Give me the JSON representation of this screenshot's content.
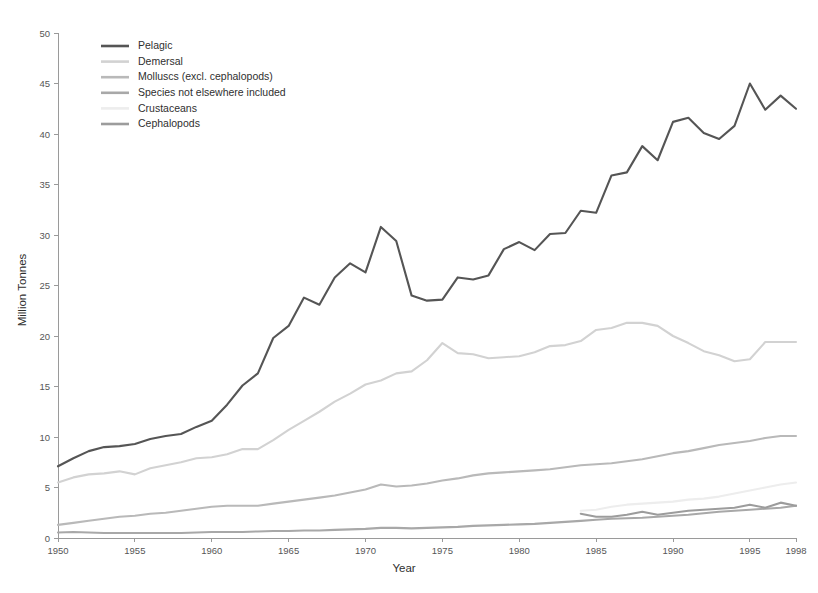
{
  "chart_data": {
    "type": "line",
    "title": "",
    "xlabel": "Year",
    "ylabel": "Million Tonnes",
    "xlim": [
      1950,
      1998
    ],
    "ylim": [
      0,
      50
    ],
    "yticks": [
      0,
      5,
      10,
      15,
      20,
      25,
      30,
      35,
      40,
      45,
      50
    ],
    "xticks": [
      1950,
      1955,
      1960,
      1965,
      1970,
      1975,
      1980,
      1985,
      1990,
      1995,
      1998
    ],
    "grid": false,
    "legend_position": "top-left",
    "x": [
      1950,
      1951,
      1952,
      1953,
      1954,
      1955,
      1956,
      1957,
      1958,
      1959,
      1960,
      1961,
      1962,
      1963,
      1964,
      1965,
      1966,
      1967,
      1968,
      1969,
      1970,
      1971,
      1972,
      1973,
      1974,
      1975,
      1976,
      1977,
      1978,
      1979,
      1980,
      1981,
      1982,
      1983,
      1984,
      1985,
      1986,
      1987,
      1988,
      1989,
      1990,
      1991,
      1992,
      1993,
      1994,
      1995,
      1996,
      1997,
      1998
    ],
    "series": [
      {
        "name": "Pelagic",
        "color": "#555555",
        "x": [
          1950,
          1951,
          1952,
          1953,
          1954,
          1955,
          1956,
          1957,
          1958,
          1959,
          1960,
          1961,
          1962,
          1963,
          1964,
          1965,
          1966,
          1967,
          1968,
          1969,
          1970,
          1971,
          1972,
          1973,
          1974,
          1975,
          1976,
          1977,
          1978,
          1979,
          1980,
          1981,
          1982,
          1983,
          1984,
          1985,
          1986,
          1987,
          1988,
          1989,
          1990,
          1991,
          1992,
          1993,
          1994,
          1995,
          1996,
          1997,
          1998
        ],
        "values": [
          7.1,
          7.9,
          8.6,
          9.0,
          9.1,
          9.3,
          9.8,
          10.1,
          10.3,
          11.0,
          11.6,
          13.2,
          15.1,
          16.3,
          19.8,
          21.0,
          23.8,
          23.1,
          25.8,
          27.2,
          26.3,
          30.8,
          29.4,
          24.0,
          23.5,
          23.6,
          25.8,
          25.6,
          26.0,
          28.6,
          29.3,
          28.5,
          30.1,
          30.2,
          32.4,
          32.2,
          35.9,
          36.2,
          38.8,
          37.4,
          41.2,
          41.6,
          40.1,
          39.5,
          40.8,
          45.0,
          42.4,
          43.8,
          42.5
        ]
      },
      {
        "name": "Demersal",
        "color": "#d2d2d2",
        "x": [
          1950,
          1951,
          1952,
          1953,
          1954,
          1955,
          1956,
          1957,
          1958,
          1959,
          1960,
          1961,
          1962,
          1963,
          1964,
          1965,
          1966,
          1967,
          1968,
          1969,
          1970,
          1971,
          1972,
          1973,
          1974,
          1975,
          1976,
          1977,
          1978,
          1979,
          1980,
          1981,
          1982,
          1983,
          1984,
          1985,
          1986,
          1987,
          1988,
          1989,
          1990,
          1991,
          1992,
          1993,
          1994,
          1995,
          1996,
          1997,
          1998
        ],
        "values": [
          5.5,
          6.0,
          6.3,
          6.4,
          6.6,
          6.3,
          6.9,
          7.2,
          7.5,
          7.9,
          8.0,
          8.3,
          8.8,
          8.8,
          9.7,
          10.7,
          11.6,
          12.5,
          13.5,
          14.3,
          15.2,
          15.6,
          16.3,
          16.5,
          17.6,
          19.3,
          18.3,
          18.2,
          17.8,
          17.9,
          18.0,
          18.4,
          19.0,
          19.1,
          19.5,
          20.6,
          20.8,
          21.3,
          21.3,
          21.0,
          20.0,
          19.3,
          18.5,
          18.1,
          17.5,
          17.7,
          19.4,
          19.4,
          19.4
        ]
      },
      {
        "name": "Molluscs (excl. cephalopods)",
        "color": "#b9b9b9",
        "x": [
          1950,
          1951,
          1952,
          1953,
          1954,
          1955,
          1956,
          1957,
          1958,
          1959,
          1960,
          1961,
          1962,
          1963,
          1964,
          1965,
          1966,
          1967,
          1968,
          1969,
          1970,
          1971,
          1972,
          1973,
          1974,
          1975,
          1976,
          1977,
          1978,
          1979,
          1980,
          1981,
          1982,
          1983,
          1984,
          1985,
          1986,
          1987,
          1988,
          1989,
          1990,
          1991,
          1992,
          1993,
          1994,
          1995,
          1996,
          1997,
          1998
        ],
        "values": [
          1.3,
          1.5,
          1.7,
          1.9,
          2.1,
          2.2,
          2.4,
          2.5,
          2.7,
          2.9,
          3.1,
          3.2,
          3.2,
          3.2,
          3.4,
          3.6,
          3.8,
          4.0,
          4.2,
          4.5,
          4.8,
          5.3,
          5.1,
          5.2,
          5.4,
          5.7,
          5.9,
          6.2,
          6.4,
          6.5,
          6.6,
          6.7,
          6.8,
          7.0,
          7.2,
          7.3,
          7.4,
          7.6,
          7.8,
          8.1,
          8.4,
          8.6,
          8.9,
          9.2,
          9.4,
          9.6,
          9.9,
          10.1,
          10.1
        ]
      },
      {
        "name": "Species not elsewhere included",
        "color": "#a8a8a8",
        "x": [
          1950,
          1951,
          1952,
          1953,
          1954,
          1955,
          1956,
          1957,
          1958,
          1959,
          1960,
          1961,
          1962,
          1963,
          1964,
          1965,
          1966,
          1967,
          1968,
          1969,
          1970,
          1971,
          1972,
          1973,
          1974,
          1975,
          1976,
          1977,
          1978,
          1979,
          1980,
          1981,
          1982,
          1983,
          1984,
          1985,
          1986,
          1987,
          1988,
          1989,
          1990,
          1991,
          1992,
          1993,
          1994,
          1995,
          1996,
          1997,
          1998
        ],
        "values": [
          0.55,
          0.6,
          0.55,
          0.5,
          0.5,
          0.5,
          0.5,
          0.5,
          0.5,
          0.55,
          0.6,
          0.6,
          0.6,
          0.65,
          0.7,
          0.7,
          0.75,
          0.75,
          0.8,
          0.85,
          0.9,
          1.0,
          1.0,
          0.95,
          1.0,
          1.05,
          1.1,
          1.2,
          1.25,
          1.3,
          1.35,
          1.4,
          1.5,
          1.6,
          1.7,
          1.8,
          1.9,
          1.95,
          2.0,
          2.1,
          2.2,
          2.3,
          2.45,
          2.6,
          2.7,
          2.8,
          2.9,
          3.0,
          3.2
        ]
      },
      {
        "name": "Crustaceans",
        "color": "#ededed",
        "x": [
          1984,
          1985,
          1986,
          1987,
          1988,
          1989,
          1990,
          1991,
          1992,
          1993,
          1994,
          1995,
          1996,
          1997,
          1998
        ],
        "values": [
          2.7,
          2.8,
          3.1,
          3.3,
          3.4,
          3.5,
          3.6,
          3.8,
          3.9,
          4.1,
          4.4,
          4.7,
          5.0,
          5.3,
          5.5
        ]
      },
      {
        "name": "Cephalopods",
        "color": "#9c9c9c",
        "x": [
          1984,
          1985,
          1986,
          1987,
          1988,
          1989,
          1990,
          1991,
          1992,
          1993,
          1994,
          1995,
          1996,
          1997,
          1998
        ],
        "values": [
          2.4,
          2.1,
          2.1,
          2.3,
          2.6,
          2.3,
          2.5,
          2.7,
          2.8,
          2.9,
          3.0,
          3.3,
          3.0,
          3.5,
          3.2
        ]
      }
    ]
  },
  "legend": {
    "items": [
      {
        "label": "Pelagic"
      },
      {
        "label": "Demersal"
      },
      {
        "label": "Molluscs (excl. cephalopods)"
      },
      {
        "label": "Species not elsewhere included"
      },
      {
        "label": "Crustaceans"
      },
      {
        "label": "Cephalopods"
      }
    ]
  }
}
